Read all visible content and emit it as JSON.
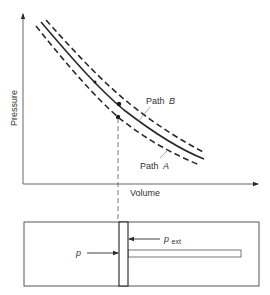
{
  "diagram": {
    "axes": {
      "y_label": "Pressure",
      "x_label": "Volume"
    },
    "paths": [
      {
        "name": "Path",
        "letter": "B",
        "description": "upper dashed curve"
      },
      {
        "name": "Path",
        "letter": "A",
        "description": "lower dashed curve"
      }
    ],
    "center_curve": "solid curve between Path A and Path B (reversible isotherm)",
    "piston": {
      "internal_pressure_label": "p",
      "external_pressure_label": "p",
      "external_pressure_subscript": "ext"
    },
    "colors": {
      "line": "#2a2a2a",
      "text": "#333333",
      "background": "#ffffff"
    }
  }
}
